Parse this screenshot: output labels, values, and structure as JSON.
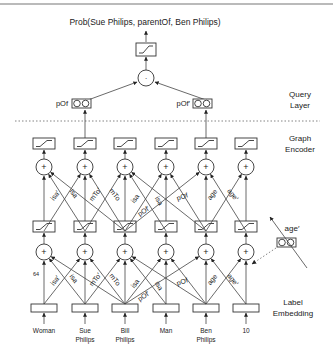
{
  "title": "Prob(Sue Philips, parentOf, Ben Philips)",
  "layers": {
    "query": [
      "Query",
      "Layer"
    ],
    "encoder": [
      "Graph",
      "Encoder"
    ],
    "embedding": [
      "Label",
      "Embedding"
    ]
  },
  "query_nodes": [
    {
      "label": "pOf",
      "col": 1
    },
    {
      "label": "pOf′",
      "col": 4
    }
  ],
  "dot_op": "·",
  "plus_op": "+",
  "dim_label": "64",
  "side_relation": "age′",
  "input_labels": [
    [
      "Woman"
    ],
    [
      "Sue",
      "Philips"
    ],
    [
      "Bill",
      "Philips"
    ],
    [
      "Man"
    ],
    [
      "Ben",
      "Philips"
    ],
    [
      "10"
    ]
  ],
  "edge_labels": [
    {
      "text": "isa′",
      "x": 57,
      "y": 197,
      "angle": -52
    },
    {
      "text": "isa",
      "x": 72,
      "y": 195,
      "angle": 52
    },
    {
      "text": "mTo′",
      "x": 97,
      "y": 196,
      "angle": -52
    },
    {
      "text": "mTo",
      "x": 113,
      "y": 196,
      "angle": 52
    },
    {
      "text": "isa",
      "x": 137,
      "y": 200,
      "angle": -52
    },
    {
      "text": "pOf′",
      "x": 145,
      "y": 213,
      "angle": -35
    },
    {
      "text": "isa",
      "x": 157,
      "y": 202,
      "angle": 60
    },
    {
      "text": "pOf",
      "x": 183,
      "y": 199,
      "angle": -18
    },
    {
      "text": "age",
      "x": 214,
      "y": 196,
      "angle": -52
    },
    {
      "text": "age′",
      "x": 231,
      "y": 196,
      "angle": 52
    }
  ]
}
